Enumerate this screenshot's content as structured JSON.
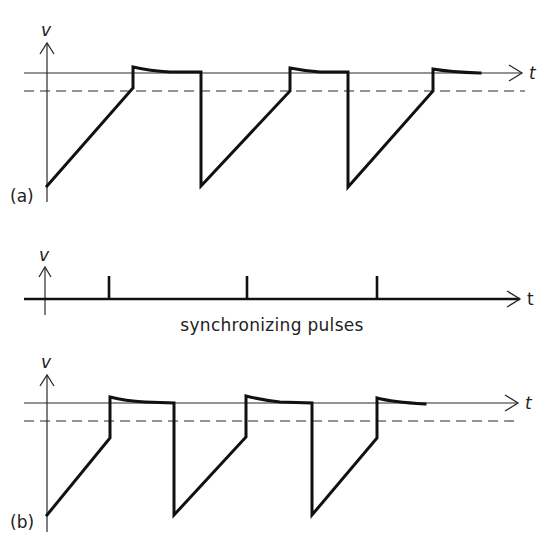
{
  "figure": {
    "panel_a": {
      "label": "(a)",
      "v_axis_label": "v",
      "t_axis_label": "t",
      "description": "free-running sawtooth waveform"
    },
    "pulses": {
      "v_axis_label": "v",
      "t_axis_label": "t",
      "caption": "synchronizing pulses",
      "pulse_count": 3
    },
    "panel_b": {
      "label": "(b)",
      "v_axis_label": "v",
      "t_axis_label": "t",
      "description": "synchronized sawtooth waveform triggered by pulses"
    }
  },
  "geometry": {
    "panel_a": {
      "v_axis": {
        "x": 47,
        "y_top": 43,
        "y_bottom": 202
      },
      "solid_level_y": 73,
      "dashed_level_y": 91,
      "t_axis": {
        "x_start": 24,
        "x_end": 522
      },
      "dashed": {
        "x_start": 24,
        "x_end": 525
      },
      "waveform": "M47,186 L133,88 L133,67 Q150,71 170,72 L201,72 L201,186 L290,91 L290,68 Q305,71 320,72 L348,72 L348,187 L433,91 L433,69 Q450,72 480,73"
    },
    "pulses": {
      "v_axis": {
        "x": 45,
        "y_top": 267,
        "y_bottom": 315
      },
      "axis_y": 299,
      "axis_x_start": 24,
      "axis_x_end": 520,
      "pulse_x": [
        109,
        247,
        377
      ],
      "pulse_top_y": 276
    },
    "panel_b": {
      "v_axis": {
        "x": 47,
        "y_top": 375,
        "y_bottom": 532
      },
      "solid_level_y": 403,
      "dashed_level_y": 421,
      "t_axis": {
        "x_start": 24,
        "x_end": 518
      },
      "dashed": {
        "x_start": 24,
        "x_end": 515
      },
      "waveform": "M47,515 L110,438 L110,397 Q125,401 145,402 L174,403 L174,515 L246,437 L246,396 Q262,400 280,402 L312,403 L312,515 L377,438 L377,398 Q392,402 425,404"
    }
  },
  "colors": {
    "background": "#ffffff",
    "ink": "#111111"
  }
}
